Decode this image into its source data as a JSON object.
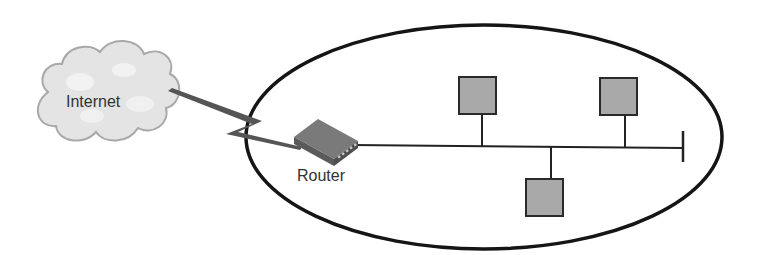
{
  "diagram": {
    "type": "network-topology",
    "labels": {
      "internet": "Internet",
      "router": "Router"
    },
    "colors": {
      "cloud_fill": "#e4e4e4",
      "cloud_stroke": "#a8a8a8",
      "host_fill": "#a9a9a9",
      "host_stroke": "#2a2a2a",
      "line": "#222222",
      "wan_link": "#555555",
      "router_top": "#7a7a7a",
      "router_side": "#4e4e4e"
    },
    "nodes": [
      {
        "id": "internet",
        "kind": "cloud",
        "label": "Internet"
      },
      {
        "id": "router",
        "kind": "router",
        "label": "Router"
      },
      {
        "id": "host-1",
        "kind": "host",
        "position": "above bus"
      },
      {
        "id": "host-2",
        "kind": "host",
        "position": "above bus"
      },
      {
        "id": "host-3",
        "kind": "host",
        "position": "below bus"
      }
    ],
    "edges": [
      {
        "from": "internet",
        "to": "router",
        "kind": "wan-lightning-link"
      },
      {
        "from": "router",
        "to": "bus",
        "kind": "ethernet-bus"
      }
    ],
    "enclosure": "ellipse (local network)"
  }
}
